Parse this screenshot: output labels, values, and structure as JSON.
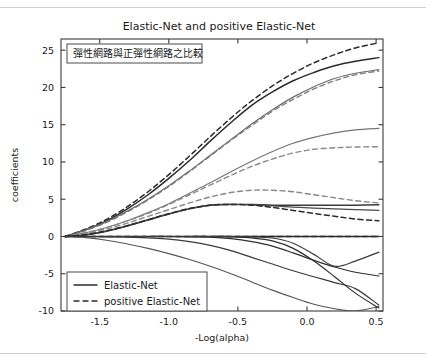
{
  "figure": {
    "title": "Elastic-Net and positive Elastic-Net",
    "annotation": "彈性網路與正彈性網路之比較"
  },
  "legend": {
    "entries": [
      {
        "label": "Elastic-Net",
        "style": "solid"
      },
      {
        "label": "positive Elastic-Net",
        "style": "dashed"
      }
    ]
  },
  "chart_data": {
    "type": "line",
    "title": "Elastic-Net and positive Elastic-Net",
    "xlabel": "-Log(alpha)",
    "ylabel": "coefficients",
    "xlim": [
      -1.78,
      0.55
    ],
    "ylim": [
      -10,
      26.5
    ],
    "xticks": [
      -1.5,
      -1.0,
      -0.5,
      0.0,
      0.5
    ],
    "xtick_labels": [
      "-1.5",
      "-1.0",
      "-0.5",
      "0.0",
      "0.5"
    ],
    "yticks": [
      -10,
      -5,
      0,
      5,
      10,
      15,
      20,
      25
    ],
    "ytick_labels": [
      "-10",
      "-5",
      "0",
      "5",
      "10",
      "15",
      "20",
      "25"
    ],
    "grid": false,
    "legend_position": "lower left",
    "annotation": "彈性網路與正彈性網路之比較",
    "x": [
      -1.75,
      -1.6,
      -1.45,
      -1.3,
      -1.15,
      -1.0,
      -0.85,
      -0.7,
      -0.55,
      -0.4,
      -0.25,
      -0.1,
      0.05,
      0.2,
      0.35,
      0.52
    ],
    "series": [
      {
        "name": "enet-1",
        "style": "solid",
        "color": "#2b2b2b",
        "width": 1.5,
        "values": [
          0.0,
          0.9,
          2.1,
          3.7,
          5.6,
          7.8,
          10.2,
          12.8,
          15.3,
          17.6,
          19.4,
          20.9,
          22.0,
          22.9,
          23.5,
          24.0
        ]
      },
      {
        "name": "penet-1",
        "style": "dashed",
        "color": "#2b2b2b",
        "width": 1.5,
        "values": [
          0.0,
          1.0,
          2.3,
          4.0,
          6.0,
          8.3,
          10.8,
          13.4,
          15.9,
          18.2,
          20.2,
          21.9,
          23.3,
          24.4,
          25.3,
          26.0
        ]
      },
      {
        "name": "enet-2",
        "style": "solid",
        "color": "#6b6b6b",
        "width": 1.2,
        "values": [
          0.0,
          0.9,
          2.0,
          3.4,
          5.0,
          6.8,
          8.8,
          10.9,
          13.0,
          15.1,
          17.0,
          18.7,
          20.1,
          21.2,
          21.9,
          22.4
        ]
      },
      {
        "name": "penet-2",
        "style": "dashed",
        "color": "#7a7a7a",
        "width": 1.3,
        "values": [
          0.0,
          0.8,
          1.9,
          3.3,
          4.9,
          6.7,
          8.7,
          10.8,
          12.9,
          14.9,
          16.8,
          18.4,
          19.8,
          20.9,
          21.7,
          22.2
        ]
      },
      {
        "name": "enet-3",
        "style": "solid",
        "color": "#757575",
        "width": 1.1,
        "values": [
          0.0,
          0.5,
          1.2,
          2.1,
          3.2,
          4.4,
          5.8,
          7.2,
          8.7,
          10.1,
          11.4,
          12.5,
          13.3,
          13.9,
          14.3,
          14.5
        ]
      },
      {
        "name": "penet-3",
        "style": "dashed",
        "color": "#8a8a8a",
        "width": 1.4,
        "values": [
          0.0,
          0.5,
          1.2,
          2.1,
          3.1,
          4.3,
          5.6,
          6.9,
          8.2,
          9.4,
          10.4,
          11.2,
          11.7,
          11.9,
          12.0,
          12.05
        ]
      },
      {
        "name": "penet-4",
        "style": "dashed",
        "color": "#8a8a8a",
        "width": 1.4,
        "values": [
          0.0,
          0.4,
          1.0,
          1.8,
          2.7,
          3.6,
          4.5,
          5.3,
          5.9,
          6.2,
          6.2,
          6.0,
          5.6,
          5.2,
          4.8,
          4.5
        ]
      },
      {
        "name": "enet-4",
        "style": "solid",
        "color": "#3a3a3a",
        "width": 1.4,
        "values": [
          0.0,
          0.2,
          0.7,
          1.4,
          2.2,
          3.0,
          3.7,
          4.2,
          4.3,
          4.3,
          4.2,
          4.2,
          4.2,
          4.2,
          4.2,
          4.25
        ]
      },
      {
        "name": "enet-5",
        "style": "solid",
        "color": "#4a4a4a",
        "width": 1.3,
        "values": [
          0.0,
          0.25,
          0.75,
          1.45,
          2.25,
          3.05,
          3.75,
          4.2,
          4.3,
          4.25,
          4.1,
          3.95,
          3.8,
          3.7,
          3.6,
          3.5
        ]
      },
      {
        "name": "penet-5",
        "style": "dashed",
        "color": "#2b2b2b",
        "width": 1.5,
        "values": [
          0.0,
          0.25,
          0.75,
          1.45,
          2.25,
          3.05,
          3.75,
          4.2,
          4.3,
          4.2,
          3.9,
          3.5,
          3.1,
          2.7,
          2.35,
          2.1
        ]
      },
      {
        "name": "penet-zero",
        "style": "dashed",
        "color": "#2b2b2b",
        "width": 1.4,
        "values": [
          0.0,
          0.0,
          0.0,
          0.0,
          0.0,
          0.0,
          0.0,
          0.0,
          0.0,
          0.0,
          0.0,
          0.0,
          0.0,
          0.0,
          0.0,
          0.0
        ]
      },
      {
        "name": "enet-zero",
        "style": "solid",
        "color": "#2b2b2b",
        "width": 1.4,
        "values": [
          0.0,
          0.0,
          0.0,
          0.0,
          0.0,
          0.0,
          0.0,
          0.0,
          0.0,
          0.0,
          0.0,
          0.0,
          0.0,
          0.0,
          0.0,
          0.0
        ]
      },
      {
        "name": "enet-6",
        "style": "solid",
        "color": "#555555",
        "width": 1.1,
        "values": [
          0.0,
          -0.15,
          -0.5,
          -1.0,
          -1.6,
          -2.3,
          -3.1,
          -4.0,
          -5.0,
          -6.1,
          -7.2,
          -8.2,
          -9.1,
          -9.7,
          -10.0,
          -9.4
        ]
      },
      {
        "name": "enet-7",
        "style": "solid",
        "color": "#3a3a3a",
        "width": 1.2,
        "values": [
          0.0,
          0.0,
          -0.05,
          -0.1,
          -0.2,
          -0.35,
          -0.7,
          -1.2,
          -1.9,
          -2.8,
          -3.7,
          -4.6,
          -5.4,
          -6.2,
          -7.0,
          -9.2
        ]
      },
      {
        "name": "enet-8",
        "style": "solid",
        "color": "#2f2f2f",
        "width": 1.2,
        "values": [
          0.0,
          0.0,
          0.0,
          0.0,
          0.0,
          0.0,
          -0.05,
          -0.1,
          -0.3,
          -0.7,
          -1.3,
          -2.2,
          -3.2,
          -4.1,
          -4.8,
          -5.3
        ]
      },
      {
        "name": "enet-9",
        "style": "solid",
        "color": "#2f2f2f",
        "width": 1.2,
        "values": [
          0.0,
          0.0,
          0.0,
          0.0,
          0.0,
          0.0,
          0.0,
          0.0,
          -0.05,
          -0.2,
          -0.6,
          -1.6,
          -3.3,
          -5.4,
          -7.6,
          -9.6
        ]
      },
      {
        "name": "enet-10",
        "style": "solid",
        "color": "#3a3a3a",
        "width": 1.2,
        "values": [
          0.0,
          0.0,
          0.0,
          0.0,
          0.0,
          0.0,
          0.0,
          0.0,
          0.0,
          -0.05,
          -0.2,
          -0.9,
          -2.4,
          -4.0,
          -3.3,
          -2.1
        ]
      }
    ]
  }
}
